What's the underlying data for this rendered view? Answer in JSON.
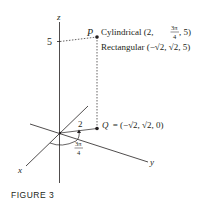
{
  "figure": {
    "caption": "FIGURE 3",
    "axes": {
      "x": "x",
      "y": "y",
      "z": "z"
    },
    "z_tick": "5",
    "point_p": {
      "name": "P",
      "cyl_prefix": "Cylindrical (2, ",
      "cyl_frac_num": "3π",
      "cyl_frac_den": "4",
      "cyl_suffix": ", 5)",
      "rect": "Rectangular (−√2, √2, 5)"
    },
    "point_q": {
      "name": "Q",
      "coords": "= (−√2, √2, 0)"
    },
    "radius_label": "2",
    "angle_num": "3π",
    "angle_den": "4",
    "colors": {
      "ink": "#231f20"
    }
  }
}
